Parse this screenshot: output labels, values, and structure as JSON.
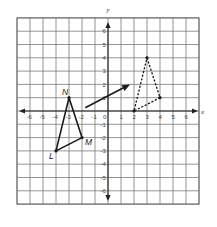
{
  "diagram": {
    "type": "coordinate-plane-translation",
    "axes": {
      "x_label": "x",
      "y_label": "y",
      "x_min": -7,
      "x_max": 7,
      "y_min": -7,
      "y_max": 7,
      "x_tick_labels": [
        "-6",
        "-5",
        "-4",
        "-3",
        "-2",
        "-1",
        "0",
        "1",
        "2",
        "3",
        "4",
        "5",
        "6"
      ],
      "y_tick_labels": [
        "6",
        "5",
        "4",
        "3",
        "2",
        "1",
        "-1",
        "-2",
        "-3",
        "-4",
        "-5",
        "-6"
      ],
      "origin_label": "0"
    },
    "preimage": {
      "style": "solid",
      "vertices": [
        {
          "label": "N",
          "x": -3,
          "y": 1
        },
        {
          "label": "M",
          "x": -2,
          "y": -2
        },
        {
          "label": "L",
          "x": -4,
          "y": -3
        }
      ]
    },
    "image": {
      "style": "dashed",
      "vertices": [
        {
          "label": "",
          "x": 3,
          "y": 4
        },
        {
          "label": "",
          "x": 4,
          "y": 1
        },
        {
          "label": "",
          "x": 2,
          "y": 0
        }
      ]
    },
    "arrow": {
      "from": {
        "x": -1.75,
        "y": 0.25
      },
      "to": {
        "x": 1.7,
        "y": 2
      }
    },
    "colors": {
      "grid": "#7a7a7a",
      "axis": "#222222",
      "figure": "#1a1a1a",
      "background": "#ffffff"
    }
  }
}
